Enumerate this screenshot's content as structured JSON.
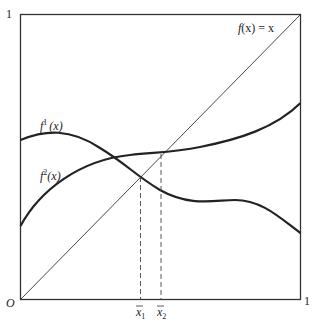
{
  "diagram": {
    "axis": {
      "origin_label": "O",
      "x_max_label": "1",
      "y_max_label": "1"
    },
    "curves": {
      "identity_label_f": "f",
      "identity_label_rest": "(x) = x",
      "f1_label_f": "f",
      "f1_label_sup": "1",
      "f1_label_arg": "(x)",
      "f2_label_f": "f",
      "f2_label_sup": "2",
      "f2_label_arg": "(x)"
    },
    "fixed_points": {
      "x1_label": "x",
      "x1_sub": "1",
      "x2_label": "x",
      "x2_sub": "2"
    }
  }
}
